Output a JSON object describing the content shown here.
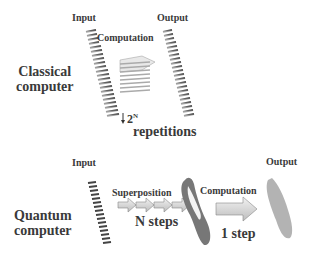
{
  "classical": {
    "title_line1": "Classical",
    "title_line2": "computer",
    "input_label": "Input",
    "output_label": "Output",
    "computation_label": "Computation",
    "repetitions_base": "2",
    "repetitions_exp": "N",
    "repetitions_label": "repetitions"
  },
  "quantum": {
    "title_line1": "Quantum",
    "title_line2": "computer",
    "input_label": "Input",
    "output_label": "Output",
    "superposition_label": "Superposition",
    "superposition_steps": "N steps",
    "computation_label": "Computation",
    "computation_steps": "1 step"
  },
  "colors": {
    "coil": "#555555",
    "arrow_fill": "#d9d9d9",
    "text": "#3a3a3a"
  }
}
